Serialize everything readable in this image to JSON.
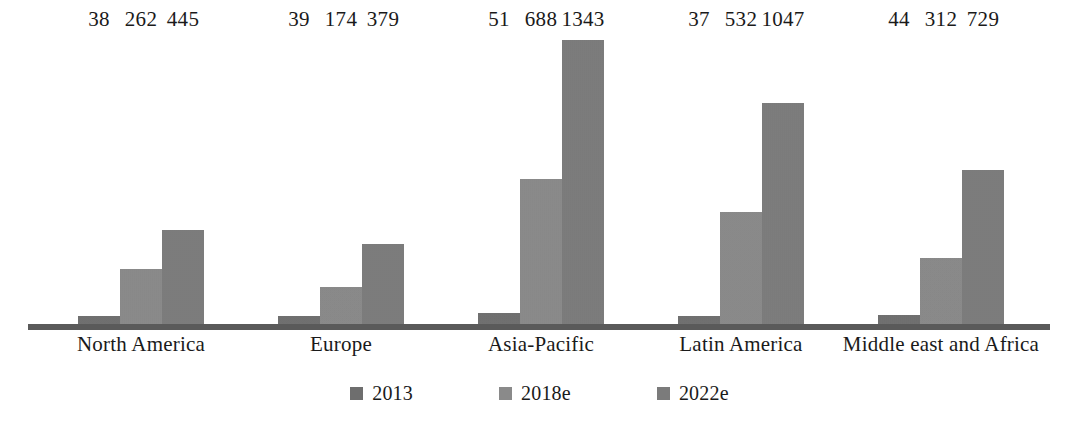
{
  "chart_data": {
    "type": "bar",
    "title": "",
    "subtitle": "",
    "xlabel": "",
    "ylabel": "",
    "grid": false,
    "legend_position": "bottom",
    "axis": {
      "baseline_visible": true,
      "y_axis_visible": false,
      "ylim": [
        0,
        1343
      ]
    },
    "categories": [
      "North America",
      "Europe",
      "Asia-Pacific",
      "Latin America",
      "Middle east and Africa"
    ],
    "series": [
      {
        "name": "2013",
        "color": "#6e6e6e",
        "values": [
          38,
          39,
          51,
          37,
          44
        ]
      },
      {
        "name": "2018e",
        "color": "#8a8a8a",
        "values": [
          262,
          174,
          688,
          532,
          312
        ]
      },
      {
        "name": "2022e",
        "color": "#7b7b7b",
        "values": [
          445,
          379,
          1343,
          1047,
          729
        ]
      }
    ],
    "data_labels": [
      [
        "38",
        "262",
        "445"
      ],
      [
        "39",
        "174",
        "379"
      ],
      [
        "51",
        "688",
        "1343"
      ],
      [
        "37",
        "532",
        "1047"
      ],
      [
        "44",
        "312",
        "729"
      ]
    ]
  },
  "legend": {
    "items": [
      {
        "label": "2013",
        "swatch": "legend-swatch-2013"
      },
      {
        "label": "2018e",
        "swatch": "legend-swatch-2018e"
      },
      {
        "label": "2022e",
        "swatch": "legend-swatch-2022e"
      }
    ]
  },
  "colors": {
    "background": "#ffffff",
    "axis": "#5a5a5a",
    "text": "#1a1a1a",
    "bar_2013": "#6e6e6e",
    "bar_2018e": "#8a8a8a",
    "bar_2022e": "#7b7b7b"
  }
}
